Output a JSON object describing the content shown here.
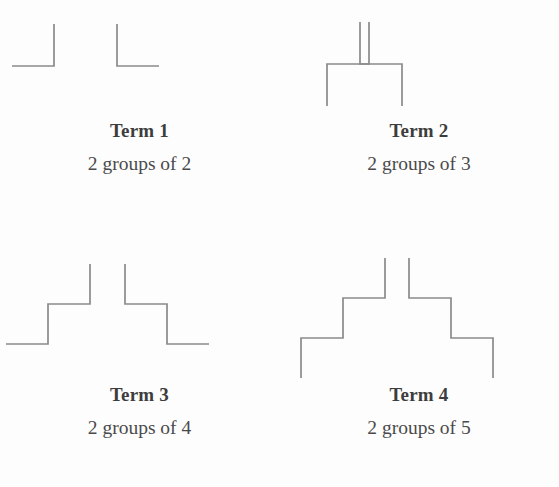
{
  "page": {
    "background_color": "#fdfdfd",
    "line_color": "#8a8a8a",
    "text_color": "#3d3d3d"
  },
  "terms": [
    {
      "title": "Term 1",
      "description": "2 groups of 2",
      "groups": 2,
      "items_per_group": 2,
      "steps": 1,
      "left_path": "M 12 66 L 54 66 L 54 24",
      "right_path": "M 117 24 L 117 66 L 159 66"
    },
    {
      "title": "Term 2",
      "description": "2 groups of 3",
      "groups": 2,
      "items_per_group": 3,
      "steps": 1,
      "left_path": "M 48 106 L 48 64 L 90 64 L 90 22",
      "right_path": "M 81 22 L 81 64 L 123 64 L 123 106"
    },
    {
      "title": "Term 3",
      "description": "2 groups of 4",
      "groups": 2,
      "items_per_group": 4,
      "steps": 2,
      "left_path": "M 6 94 L 48 94 L 48 54 L 90 54 L 90 14",
      "right_path": "M 125 14 L 125 54 L 167 54 L 167 94 L 209 94"
    },
    {
      "title": "Term 4",
      "description": "2 groups of 5",
      "groups": 2,
      "items_per_group": 5,
      "steps": 2,
      "left_path": "M 22 128 L 22 88 L 64 88 L 64 48 L 106 48 L 106 8",
      "right_path": "M 130 8 L 130 48 L 172 48 L 172 88 L 214 88 L 214 128"
    }
  ]
}
